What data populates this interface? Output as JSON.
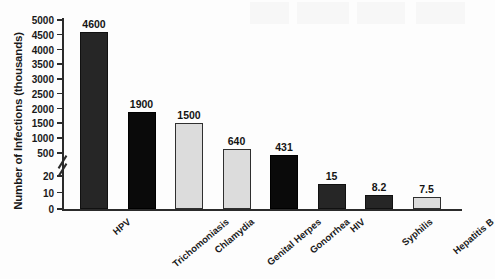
{
  "chart_data": {
    "type": "bar",
    "title": "",
    "xlabel": "",
    "ylabel": "Number of Infections (thousands)",
    "categories": [
      "HPV",
      "Trichomoniasis",
      "Chlamydia",
      "Genital Herpes",
      "Gonorrhea",
      "HIV",
      "Syphilis",
      "Hepatitis B"
    ],
    "values": [
      4600,
      1900,
      1500,
      640,
      431,
      15,
      8.2,
      7.5
    ],
    "value_labels": [
      "4600",
      "1900",
      "1500",
      "640",
      "431",
      "15",
      "8.2",
      "7.5"
    ],
    "bar_styles": [
      "dark",
      "black",
      "light",
      "light",
      "black",
      "dark",
      "dark",
      "light"
    ],
    "broken_axis": true,
    "axis_lower_ticks": [
      "0",
      "10",
      "20"
    ],
    "axis_upper_ticks": [
      "500",
      "1000",
      "1500",
      "2000",
      "2500",
      "3000",
      "3500",
      "4000",
      "4500",
      "5000"
    ],
    "ylim_lower": [
      0,
      20
    ],
    "ylim_upper": [
      500,
      5000
    ],
    "grid": false,
    "legend": "none",
    "colors": {
      "dark": "#262626",
      "black": "#0a0a0a",
      "light": "#dcdcdc",
      "axis": "#2b2b2b",
      "text": "#1a1a1a",
      "background": "#fdfdfd"
    }
  }
}
